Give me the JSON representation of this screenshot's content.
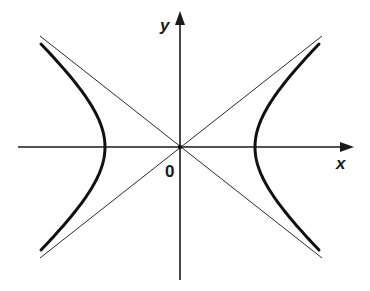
{
  "diagram": {
    "type": "hyperbola-with-asymptotes",
    "labels": {
      "x_axis": "x",
      "y_axis": "y",
      "origin": "0"
    },
    "geometry": {
      "origin": [
        180,
        147
      ],
      "vertex_left": [
        105,
        147
      ],
      "vertex_right": [
        255,
        147
      ],
      "x_axis": {
        "from": [
          18,
          147
        ],
        "to": [
          352,
          147
        ]
      },
      "y_axis": {
        "from": [
          180,
          280
        ],
        "to": [
          180,
          12
        ]
      },
      "asymptotes": [
        {
          "from": [
            40,
            36
          ],
          "to": [
            322,
            258
          ]
        },
        {
          "from": [
            40,
            258
          ],
          "to": [
            322,
            36
          ]
        }
      ]
    },
    "colors": {
      "background": "#ffffff",
      "ink": "#1a1a1a"
    }
  }
}
